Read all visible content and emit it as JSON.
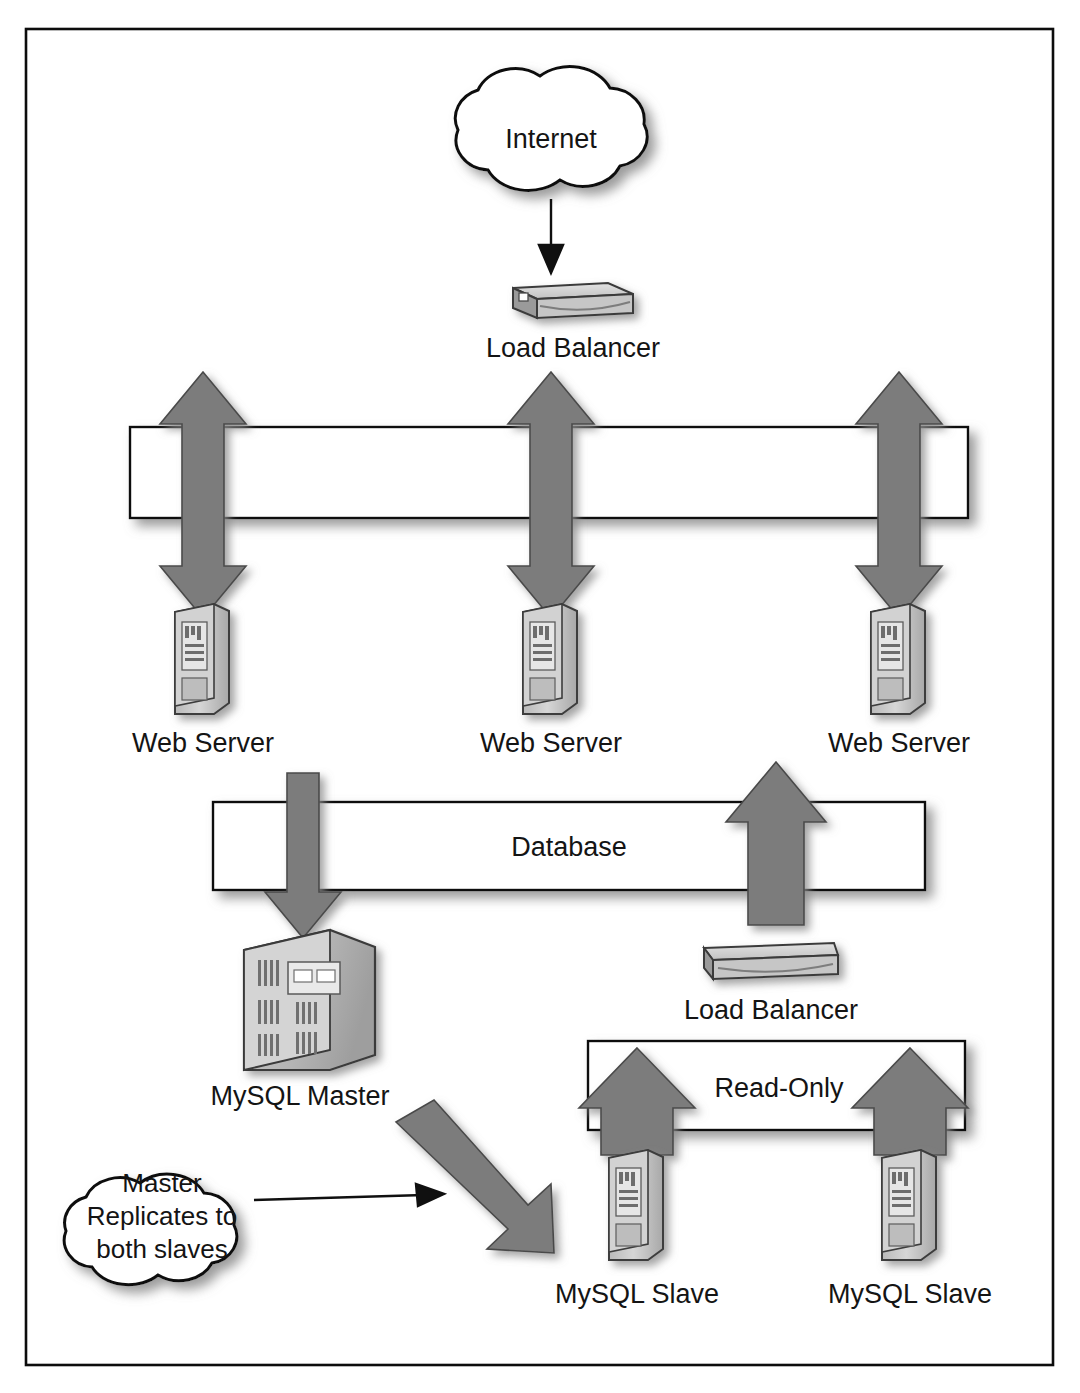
{
  "diagram": {
    "frame": {
      "visible": true,
      "color": "#0c0c0c"
    },
    "palette": {
      "arrow_gray": "#7c7c7c",
      "arrow_outline": "#4a4a4a",
      "bar_fill": "#ffffff",
      "outline": "#101010",
      "text": "#141414",
      "shadow": "#9a9a9a"
    },
    "nodes": {
      "internet": {
        "label": "Internet",
        "shape": "cloud"
      },
      "load_balancer_top": {
        "label": "Load Balancer",
        "shape": "appliance"
      },
      "web_servers": [
        {
          "label": "Web Server",
          "shape": "tower-server"
        },
        {
          "label": "Web Server",
          "shape": "tower-server"
        },
        {
          "label": "Web Server",
          "shape": "tower-server"
        }
      ],
      "mysql_master": {
        "label": "MySQL Master",
        "shape": "mainframe-box"
      },
      "load_balancer_db": {
        "label": "Load Balancer",
        "shape": "appliance"
      },
      "mysql_slaves": [
        {
          "label": "MySQL Slave",
          "shape": "tower-server"
        },
        {
          "label": "MySQL Slave",
          "shape": "tower-server"
        }
      ]
    },
    "bars": {
      "network_top": {
        "label": "",
        "labelled": false
      },
      "database": {
        "label": "Database",
        "labelled": true
      },
      "read_only": {
        "label": "Read-Only",
        "labelled": true
      }
    },
    "annotations": {
      "replication_note": {
        "lines": [
          "Master",
          "Replicates to",
          "both slaves"
        ],
        "shape": "cloud",
        "points_to": "replication-arrow"
      }
    },
    "arrows": {
      "internet_to_lb": {
        "direction": "down",
        "style": "thin-line"
      },
      "bus_to_web_1": {
        "direction": "bidirectional",
        "style": "thick-gray"
      },
      "bus_to_web_2": {
        "direction": "bidirectional",
        "style": "thick-gray"
      },
      "bus_to_web_3": {
        "direction": "bidirectional",
        "style": "thick-gray"
      },
      "database_to_master": {
        "direction": "down",
        "style": "thick-gray"
      },
      "lb_to_database": {
        "direction": "up",
        "style": "thick-gray"
      },
      "slave1_to_readonly": {
        "direction": "up",
        "style": "thick-gray"
      },
      "slave2_to_readonly": {
        "direction": "up",
        "style": "thick-gray"
      },
      "replication": {
        "direction": "down-right",
        "style": "thick-gray-diagonal"
      },
      "note_pointer": {
        "direction": "right",
        "style": "thin-line"
      }
    }
  }
}
